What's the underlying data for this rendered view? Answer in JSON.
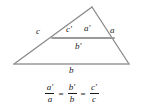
{
  "figure": {
    "background_color": "#ffffff",
    "line_color": "#8a8a8a",
    "text_color": "#1a1a1a"
  },
  "diagram": {
    "type": "geometry",
    "shape": "triangle-with-inscribed-similar-triangle",
    "outer_triangle": {
      "apex": [
        92,
        7
      ],
      "bottom_left": [
        14,
        64
      ],
      "bottom_right": [
        129,
        64
      ]
    },
    "inner_line": {
      "left": [
        52,
        38
      ],
      "right": [
        114,
        38
      ]
    },
    "labels": {
      "c": "c",
      "c_prime": "c′",
      "a_prime": "a′",
      "a": "a",
      "b_prime": "b′",
      "b": "b"
    }
  },
  "equation": {
    "terms": [
      {
        "numerator": "a′",
        "denominator": "a"
      },
      {
        "numerator": "b′",
        "denominator": "b"
      },
      {
        "numerator": "c′",
        "denominator": "c"
      }
    ],
    "operators": [
      "=",
      "="
    ],
    "plain_text": "a'/a = b'/b = c'/c"
  }
}
